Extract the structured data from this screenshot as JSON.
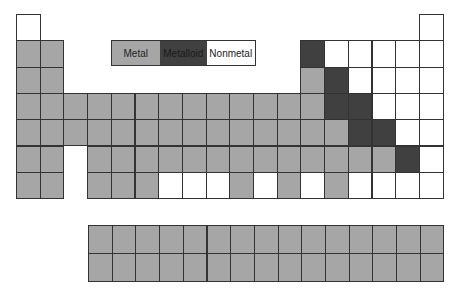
{
  "legend": {
    "items": [
      {
        "label": "Metal",
        "class": "metal",
        "color": "#a6a6a6"
      },
      {
        "label": "Metalloid",
        "class": "metalloid",
        "color": "#404040"
      },
      {
        "label": "Nonmetal",
        "class": "nonmetal",
        "color": "#ffffff"
      }
    ]
  },
  "grid": {
    "origin_x": 16,
    "origin_y": 14,
    "cell_w": 23.7,
    "cell_h": 26.3,
    "rows": [
      "N................N",
      "MM..........DNNNNN",
      "MM..........MDNNNN",
      "MMMMMMMMMMMMMDDNNN",
      "MMMMMMMMMMMMMMDDNN",
      "MM.MMMMMMMMMMMMMDN",
      "MM.MMMNNNMNMNMNNNN"
    ]
  },
  "f_block": {
    "origin_x": 88,
    "origin_y": 225,
    "cell_w": 23.7,
    "cell_h": 28,
    "rows": [
      "MMMMMMMMMMMMMMM",
      "MMMMMMMMMMMMMMM"
    ]
  },
  "colors": {
    "M": "metal",
    "D": "metalloid",
    "N": "nonmetal"
  }
}
